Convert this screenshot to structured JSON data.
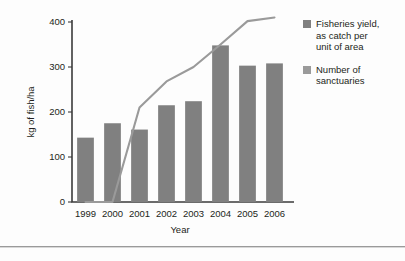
{
  "chart_data": {
    "type": "bar",
    "title": "",
    "subtitle": "",
    "xlabel": "Year",
    "ylabel": "kg of fish/ha",
    "categories": [
      "1999",
      "2000",
      "2001",
      "2002",
      "2003",
      "2004",
      "2005",
      "2006"
    ],
    "ylim": [
      0,
      400
    ],
    "yticks": [
      0,
      100,
      200,
      300,
      400
    ],
    "ytick_labels": [
      "0",
      "100",
      "200",
      "300",
      "400"
    ],
    "grid": false,
    "legend_position": "right",
    "series": [
      {
        "name": "Fisheries yield, as catch per unit of area",
        "type": "bar",
        "color": "#808080",
        "values": [
          143,
          175,
          161,
          215,
          224,
          348,
          303,
          308
        ]
      },
      {
        "name": "Number of sanctuaries",
        "type": "line",
        "color": "#9a9a9a",
        "values": [
          0,
          0,
          210,
          268,
          300,
          350,
          402,
          410
        ]
      }
    ]
  },
  "legend": {
    "entries": [
      {
        "label": "Fisheries yield,\nas catch per\nunit of area",
        "color": "#808080"
      },
      {
        "label": "Number of\nsanctuaries",
        "color": "#9a9a9a"
      }
    ]
  },
  "axes": {
    "y_axis_title": "kg of fish/ha",
    "x_axis_title": "Year"
  }
}
